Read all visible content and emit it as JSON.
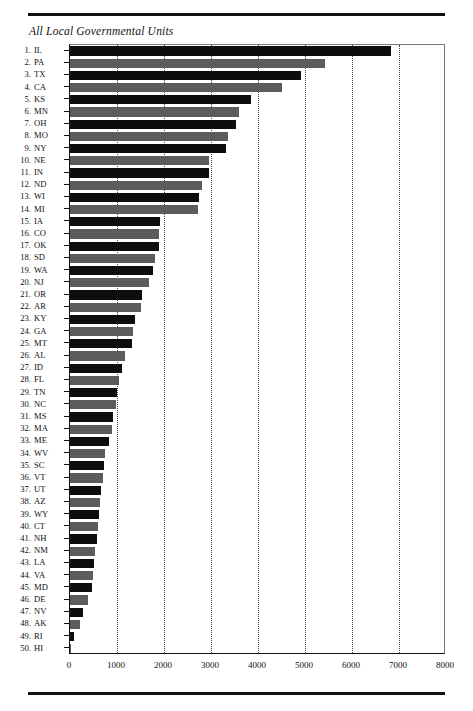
{
  "document": {
    "title": "All Local Governmental Units",
    "top_rule": true,
    "bottom_rule": true
  },
  "chart_data": {
    "type": "bar",
    "orientation": "horizontal",
    "title": "All Local Governmental Units",
    "xlabel": "",
    "ylabel": "",
    "xlim": [
      0,
      8000
    ],
    "xticks": [
      "0",
      "1000",
      "2000",
      "3000",
      "4000",
      "5000",
      "6000",
      "7000",
      "8000"
    ],
    "xtick_values": [
      0,
      1000,
      2000,
      3000,
      4000,
      5000,
      6000,
      7000,
      8000
    ],
    "grid": "vertical-dotted",
    "legend": "none",
    "bar_colors": [
      "#0d0d0d",
      "#5c5c5c"
    ],
    "categories": [
      "IL",
      "PA",
      "TX",
      "CA",
      "KS",
      "MN",
      "OH",
      "MO",
      "NY",
      "NE",
      "IN",
      "ND",
      "WI",
      "MI",
      "IA",
      "CO",
      "OK",
      "SD",
      "WA",
      "NJ",
      "OR",
      "AR",
      "KY",
      "GA",
      "MT",
      "AL",
      "ID",
      "FL",
      "TN",
      "NC",
      "MS",
      "MA",
      "ME",
      "WV",
      "SC",
      "VT",
      "UT",
      "AZ",
      "WY",
      "CT",
      "NH",
      "NM",
      "LA",
      "VA",
      "MD",
      "DE",
      "NV",
      "AK",
      "RI",
      "HI"
    ],
    "ranks": [
      1,
      2,
      3,
      4,
      5,
      6,
      7,
      8,
      9,
      10,
      11,
      12,
      13,
      14,
      15,
      16,
      17,
      18,
      19,
      20,
      21,
      22,
      23,
      24,
      25,
      26,
      27,
      28,
      29,
      30,
      31,
      32,
      33,
      34,
      35,
      36,
      37,
      38,
      39,
      40,
      41,
      42,
      43,
      44,
      45,
      46,
      47,
      48,
      49,
      50
    ],
    "values": [
      6840,
      5430,
      4920,
      4520,
      3860,
      3590,
      3525,
      3355,
      3320,
      2960,
      2950,
      2810,
      2750,
      2730,
      1915,
      1900,
      1890,
      1810,
      1775,
      1675,
      1540,
      1510,
      1375,
      1335,
      1320,
      1170,
      1115,
      1045,
      990,
      975,
      920,
      895,
      825,
      750,
      725,
      700,
      670,
      635,
      615,
      600,
      565,
      540,
      500,
      490,
      460,
      375,
      270,
      215,
      95,
      20
    ]
  }
}
